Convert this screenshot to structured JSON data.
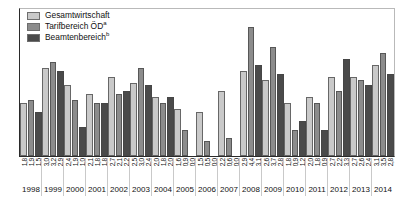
{
  "chart_data": {
    "type": "bar",
    "title": "",
    "xlabel": "",
    "ylabel": "",
    "ylim": [
      0.0,
      5.0
    ],
    "ytick_labels": [
      "0,0",
      "0,5",
      "1,0",
      "1,5",
      "2,0",
      "2,5",
      "3,0",
      "3,5",
      "4,0",
      "4,5",
      "5,0"
    ],
    "ytick_values": [
      0.0,
      0.5,
      1.0,
      1.5,
      2.0,
      2.5,
      3.0,
      3.5,
      4.0,
      4.5,
      5.0
    ],
    "grid": false,
    "legend_position": "top-left",
    "categories": [
      "1998",
      "1999",
      "2000",
      "2001",
      "2002",
      "2003",
      "2004",
      "2005",
      "2006",
      "2007",
      "2008",
      "2009",
      "2010",
      "2011",
      "2012",
      "2013",
      "2014"
    ],
    "series": [
      {
        "name": "Gesamtwirtschaft",
        "color": "#c9c9c9",
        "values": [
          1.8,
          3.0,
          2.4,
          2.1,
          2.7,
          2.5,
          2.0,
          1.6,
          1.5,
          2.2,
          2.9,
          2.6,
          1.8,
          2.0,
          2.7,
          2.7,
          3.1
        ],
        "labels": [
          "1,8",
          "3,0",
          "2,4",
          "2,1",
          "2,7",
          "2,5",
          "2,0",
          "1,6",
          "1,5",
          "2,2",
          "2,9",
          "2,6",
          "1,8",
          "2,0",
          "2,7",
          "2,7",
          "3,1"
        ]
      },
      {
        "name": "Tarifbereich ÖD",
        "footnote": "a",
        "color": "#8c8c8c",
        "values": [
          1.9,
          3.2,
          1.9,
          1.8,
          2.1,
          3.0,
          1.8,
          0.9,
          0.5,
          0.6,
          4.4,
          3.7,
          0.9,
          1.8,
          2.2,
          2.6,
          3.5
        ],
        "labels": [
          "1,9",
          "3,2",
          "1,9",
          "1,8",
          "2,1",
          "3,0",
          "1,8",
          "0,9",
          "0,5",
          "0,6",
          "4,4",
          "3,7",
          "0,9",
          "1,8",
          "2,2",
          "2,6",
          "3,5"
        ]
      },
      {
        "name": "Beamtenbereich",
        "footnote": "b",
        "color": "#4a4a4a",
        "values": [
          1.5,
          2.9,
          1.0,
          1.8,
          2.2,
          2.4,
          2.0,
          0.0,
          0.0,
          0.0,
          3.1,
          2.8,
          1.2,
          0.9,
          3.3,
          2.4,
          2.8
        ],
        "labels": [
          "1,5",
          "2,9",
          "1,0",
          "1,8",
          "2,2",
          "2,4",
          "2,0",
          "0,0",
          "0,0",
          "0,0",
          "3,1",
          "2,8",
          "1,2",
          "0,9",
          "3,3",
          "2,4",
          "2,8"
        ]
      }
    ]
  }
}
